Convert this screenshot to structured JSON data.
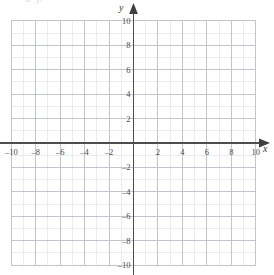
{
  "chart_data": {
    "type": "scatter",
    "title": "",
    "subtitle": "",
    "xlabel": "x",
    "ylabel": "y",
    "xlim": [
      -10,
      10
    ],
    "ylim": [
      -10,
      10
    ],
    "grid": true,
    "minor_grid_step": 1,
    "major_grid_step": 2,
    "legend": null,
    "series": [],
    "annotations": [],
    "x_tick_labels": [
      "–10",
      "–8",
      "–6",
      "–4",
      "–2",
      "2",
      "4",
      "6",
      "8",
      "10"
    ],
    "x_tick_values": [
      -10,
      -8,
      -6,
      -4,
      -2,
      2,
      4,
      6,
      8,
      10
    ],
    "y_tick_labels": [
      "10",
      "8",
      "6",
      "4",
      "2",
      "–2",
      "–4",
      "–6",
      "–8",
      "–10"
    ],
    "y_tick_values": [
      10,
      8,
      6,
      4,
      2,
      -2,
      -4,
      -6,
      -8,
      -10
    ],
    "origin_label": "",
    "colors": {
      "background": "#ffffff",
      "axis": "#4d4d4d",
      "major_grid": "#b9bfc9",
      "minor_grid": "#e4e7ec",
      "tick_text": "#4a4a4a"
    }
  },
  "axes": {
    "x_name": "x",
    "y_name": "y"
  },
  "artifact": {
    "clipped_top_text": "a  p"
  }
}
